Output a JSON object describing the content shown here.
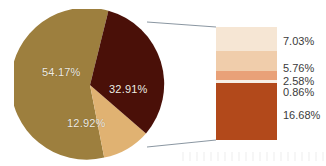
{
  "chart_data": {
    "type": "pie",
    "title": "",
    "subtitle": "",
    "xlabel": "",
    "ylabel": "",
    "legend_position": "none",
    "grid": false,
    "variant": "bar-of-pie",
    "pie": {
      "categories": [
        "54.17%",
        "32.91%",
        "12.92%"
      ],
      "values": [
        54.17,
        32.91,
        12.92
      ],
      "labels": [
        "54.17%",
        "32.91%",
        "12.92%"
      ],
      "colors": [
        "#9d7f3e",
        "#4a1008",
        "#e0b272"
      ],
      "label_color": "#f2ece2",
      "start_angle_deg": -76,
      "direction": "clockwise",
      "exploded_index": 1
    },
    "bar": {
      "source_slice": "32.91%",
      "orientation": "vertical-stacked",
      "segments": [
        {
          "label": "7.03%",
          "value": 7.03,
          "color": "#f6e6d4"
        },
        {
          "label": "5.76%",
          "value": 5.76,
          "color": "#f0cdab"
        },
        {
          "label": "2.58%",
          "value": 2.58,
          "color": "#e9a178"
        },
        {
          "label": "0.86%",
          "value": 0.86,
          "color": "#f7efe6"
        },
        {
          "label": "16.68%",
          "value": 16.68,
          "color": "#b2491b"
        }
      ],
      "label_color": "#3b3b3b",
      "total": 32.91
    }
  },
  "figure": {
    "background": "#ffffff",
    "leader_line_color": "#7d8a96"
  }
}
